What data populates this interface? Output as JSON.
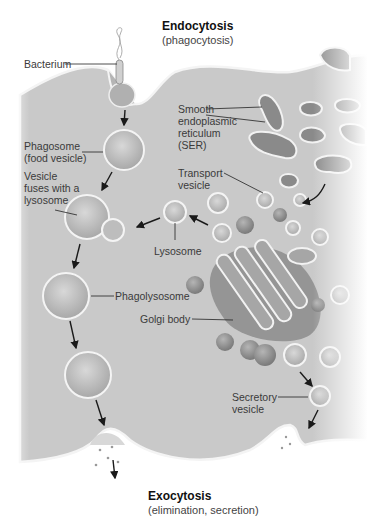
{
  "diagram": {
    "title_top": "Endocytosis",
    "subtitle_top": "(phagocytosis)",
    "title_bottom": "Exocytosis",
    "subtitle_bottom": "(elimination, secretion)",
    "labels": {
      "bacterium": "Bacterium",
      "phagosome": "Phagosome\n(food vesicle)",
      "vesicle_fuses": "Vesicle\nfuses with a\nlysosome",
      "smooth_er": "Smooth\nendoplasmic\nreticulum\n(SER)",
      "transport_vesicle": "Transport\nvesicle",
      "lysosome": "Lysosome",
      "phagolysosome": "Phagolysosome",
      "golgi_body": "Golgi body",
      "secretory_vesicle": "Secretory\nvesicle"
    },
    "colors": {
      "cytoplasm": "#c8c8c8",
      "membrane": "#f2f2f2",
      "organelle": "#9a9a9a",
      "arrow": "#1a1a1a",
      "text": "#3a3a3a"
    }
  }
}
